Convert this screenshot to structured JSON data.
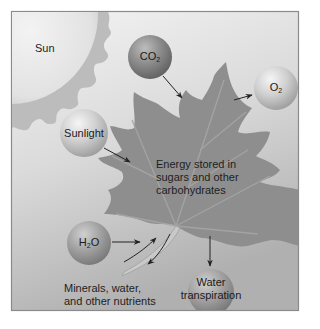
{
  "labels": {
    "sun": "Sun",
    "sunlight": "Sunlight",
    "co2": {
      "base": "CO",
      "sub": "2"
    },
    "o2": {
      "base": "O",
      "sub": "2"
    },
    "h2o": {
      "base": "H",
      "sub": "2",
      "tail": "O"
    },
    "water_transpiration_line1": "Water",
    "water_transpiration_line2": "transpiration",
    "leaf_line1": "Energy stored in",
    "leaf_line2": "sugars and other",
    "leaf_line3": "carbohydrates",
    "minerals_line1": "Minerals, water,",
    "minerals_line2": "and other nutrients"
  },
  "colors": {
    "frame_border": "#8a8a8a",
    "background_top": "#f2f2f2",
    "background_bottom": "#b2b2b2",
    "sun": "#e6e6e6",
    "sun_rays": "#b9b9b9",
    "leaf": "#8e8e8e",
    "leaf_veins": "#a8a8a8",
    "ball_dark": "#7e7e7e",
    "ball_light": "#c8c8c8",
    "arrow": "#222222"
  }
}
